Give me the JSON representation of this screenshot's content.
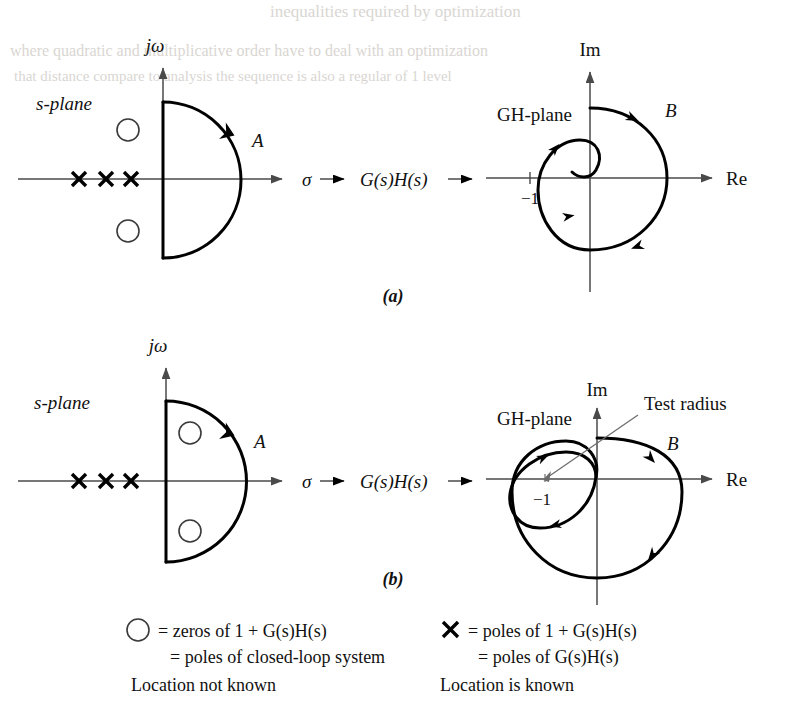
{
  "figure": {
    "kind": "nyquist-stability-criterion-diagram",
    "bleed_through_lines": [
      "inequalities required by optimization",
      "where quadratic and multiplicative order have to deal with an optimization",
      "that distance compare to analysis the sequence is also a regular of 1 level"
    ],
    "panels": [
      {
        "id": "(a)",
        "id_y": 295,
        "s_plane": {
          "label": "s-plane",
          "vertical_axis_label": "jω",
          "horizontal_axis_label": "σ",
          "contour_label": "A",
          "poles_count": 3,
          "zeros_count": 2,
          "zeros_location": "left-half-plane (outside contour)"
        },
        "mapping": {
          "function_label": "G(s)H(s)"
        },
        "gh_plane": {
          "label": "GH-plane",
          "vertical_axis_label": "Im",
          "horizontal_axis_label": "Re",
          "critical_point_label": "−1",
          "contour_label": "B",
          "encirclements_of_minus_one": 0,
          "test_radius_label": null
        }
      },
      {
        "id": "(b)",
        "id_y": 578,
        "s_plane": {
          "label": "s-plane",
          "vertical_axis_label": "jω",
          "horizontal_axis_label": "σ",
          "contour_label": "A",
          "poles_count": 3,
          "zeros_count": 2,
          "zeros_location": "right-half-plane (inside contour)"
        },
        "mapping": {
          "function_label": "G(s)H(s)"
        },
        "gh_plane": {
          "label": "GH-plane",
          "vertical_axis_label": "Im",
          "horizontal_axis_label": "Re",
          "critical_point_label": "−1",
          "contour_label": "B",
          "encirclements_of_minus_one": 2,
          "test_radius_label": "Test radius"
        }
      }
    ],
    "legend": {
      "left": {
        "symbol": "circle",
        "line1": "= zeros of 1 + G(s)H(s)",
        "line2": "= poles of closed-loop system",
        "line3": "Location not known"
      },
      "right": {
        "symbol": "cross",
        "line1": "= poles of 1 + G(s)H(s)",
        "line2": "= poles of G(s)H(s)",
        "line3": "Location is known"
      }
    }
  }
}
